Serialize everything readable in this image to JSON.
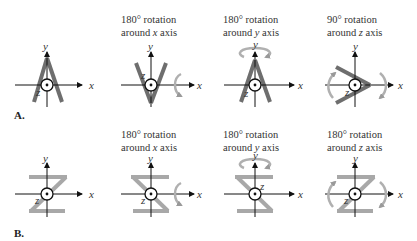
{
  "rows": [
    {
      "label": "A.",
      "shape": "A",
      "panels": [
        {
          "caption_line1": "",
          "caption_line2": "",
          "rotation": "none"
        },
        {
          "caption_line1": "180° rotation",
          "caption_line2_pre": "around ",
          "caption_axis": "x",
          "caption_line2_post": " axis",
          "rotation": "180 about x"
        },
        {
          "caption_line1": "180° rotation",
          "caption_line2_pre": "around ",
          "caption_axis": "y",
          "caption_line2_post": " axis",
          "rotation": "180 about y"
        },
        {
          "caption_line1": "90° rotation",
          "caption_line2_pre": "around ",
          "caption_axis": "z",
          "caption_line2_post": " axis",
          "rotation": "90 about z"
        }
      ]
    },
    {
      "label": "B.",
      "shape": "Z",
      "panels": [
        {
          "caption_line1": "",
          "caption_line2": "",
          "rotation": "none"
        },
        {
          "caption_line1": "180° rotation",
          "caption_line2_pre": "around ",
          "caption_axis": "x",
          "caption_line2_post": " axis",
          "rotation": "180 about x"
        },
        {
          "caption_line1": "180° rotation",
          "caption_line2_pre": "around ",
          "caption_axis": "y",
          "caption_line2_post": " axis",
          "rotation": "180 about y"
        },
        {
          "caption_line1": "180° rotation",
          "caption_line2_pre": "around ",
          "caption_axis": "z",
          "caption_line2_post": " axis",
          "rotation": "180 about z"
        }
      ]
    }
  ],
  "axes": {
    "x": "x",
    "y": "y",
    "z": "z"
  },
  "colors": {
    "shape_A": "#6e6e6e",
    "shape_Z": "#a8a8a8",
    "axis": "#111111",
    "arrow": "#b0b0b0"
  }
}
